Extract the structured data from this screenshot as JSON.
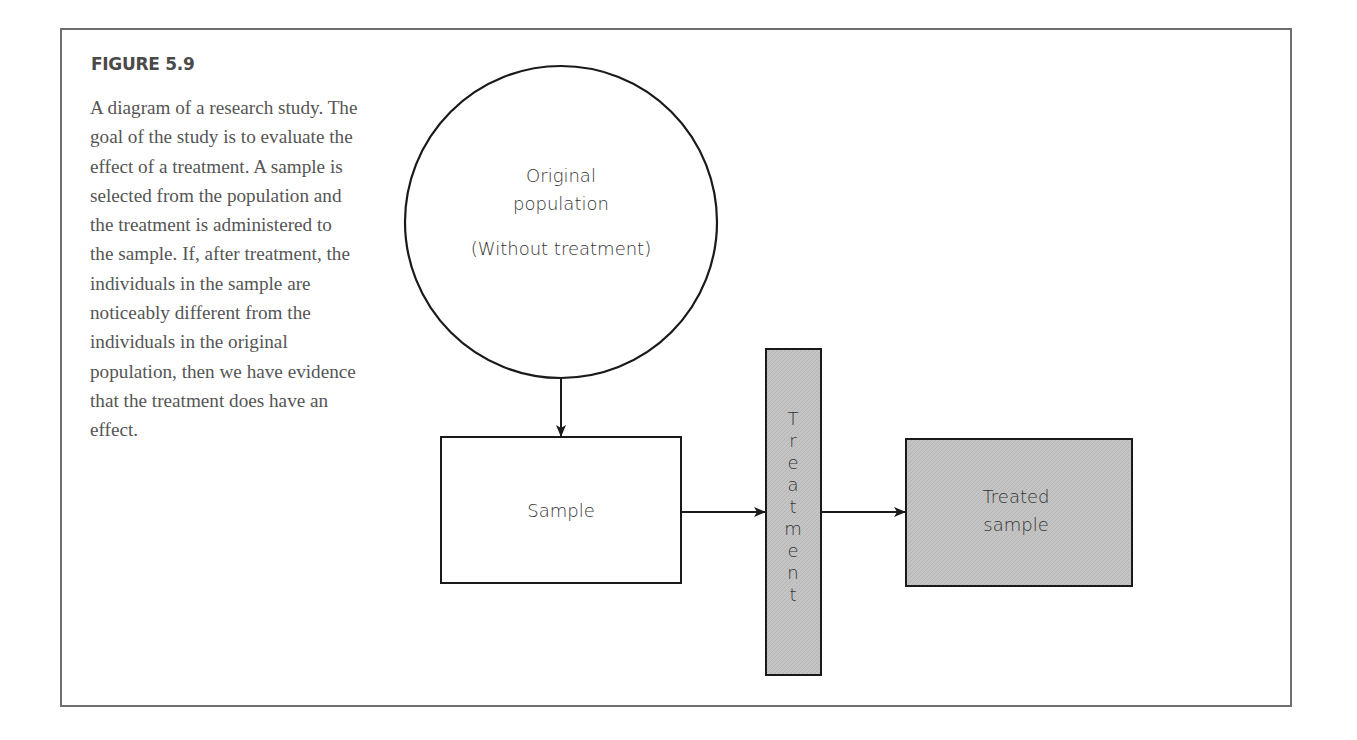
{
  "figure": {
    "label": "FIGURE 5.9",
    "caption": "A diagram of a research study. The goal of the study is to evaluate the effect of a treatment. A sample is selected from the population and the treatment is administered to the sample. If, after treatment, the individuals in the sample are noticeably different from the individuals in the original population, then we have evidence that the treatment does have an effect."
  },
  "diagram": {
    "population": {
      "line1": "Original",
      "line2": "population",
      "line3": "(Without treatment)"
    },
    "sample": {
      "label": "Sample"
    },
    "treatment": {
      "letters": [
        "T",
        "r",
        "e",
        "a",
        "t",
        "m",
        "e",
        "n",
        "t"
      ]
    },
    "treated_sample": {
      "line1": "Treated",
      "line2": "sample"
    },
    "colors": {
      "stroke": "#1a1a1a",
      "shaded_fill": "#c4c4c4",
      "frame": "#6e6e6e"
    }
  }
}
